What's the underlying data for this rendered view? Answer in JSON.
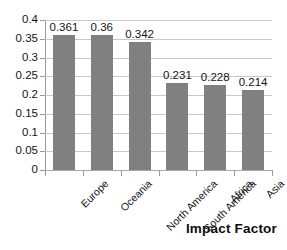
{
  "chart_data": {
    "type": "bar",
    "title": "",
    "xlabel": "Impact Factor",
    "ylabel": "",
    "categories": [
      "Europe",
      "Oceania",
      "North America",
      "South America",
      "Africa",
      "Asia"
    ],
    "values": [
      0.361,
      0.36,
      0.342,
      0.231,
      0.228,
      0.214
    ],
    "value_labels": [
      "0.361",
      "0.36",
      "0.342",
      "0.231",
      "0.228",
      "0.214"
    ],
    "ylim": [
      0,
      0.4
    ],
    "ytick_labels": [
      "0",
      "0.05",
      "0.1",
      "0.15",
      "0.2",
      "0.25",
      "0.3",
      "0.35",
      "0.4"
    ],
    "ytick_values": [
      0,
      0.05,
      0.1,
      0.15,
      0.2,
      0.25,
      0.3,
      0.35,
      0.4
    ],
    "grid": true,
    "legend": false,
    "legend_position": "none",
    "series": [
      {
        "name": "Impact Factor",
        "color": "#808080",
        "values": [
          0.361,
          0.36,
          0.342,
          0.231,
          0.228,
          0.214
        ]
      }
    ],
    "bar_color": "#808080",
    "gridline_color": "#c8c8c8",
    "axis_color": "#9a9a9a",
    "background": "#ffffff",
    "category_label_rotation": -45
  },
  "axis_title": {
    "text": "Impact Factor"
  }
}
